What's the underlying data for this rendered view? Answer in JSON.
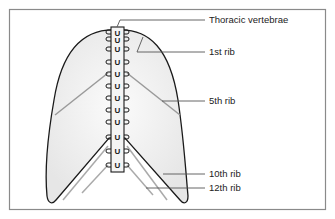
{
  "diagram": {
    "colors": {
      "frame": "#8a8a8a",
      "outline": "#1a1a1a",
      "lung_fill": "#eeeeee",
      "rib_line": "#9a9a9a",
      "leader_line": "#555555",
      "text": "#222222"
    },
    "labels": [
      {
        "id": "thoracic-vertebrae",
        "text": "Thoracic vertebrae"
      },
      {
        "id": "rib-1",
        "text": "1st rib"
      },
      {
        "id": "rib-5",
        "text": "5th rib"
      },
      {
        "id": "rib-10",
        "text": "10th rib"
      },
      {
        "id": "rib-12",
        "text": "12th rib"
      }
    ],
    "vertebra_count": 12,
    "vertebra_glyph": "U"
  }
}
